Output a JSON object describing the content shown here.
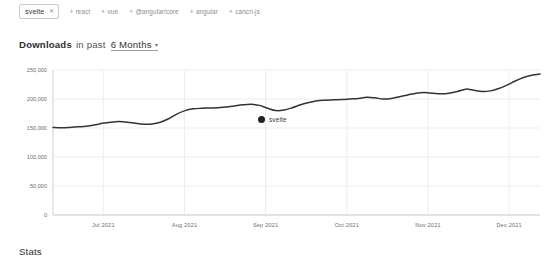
{
  "package_bar": {
    "selected_chip": {
      "label": "svelte",
      "close_icon": "close-icon",
      "close_glyph": "✕"
    },
    "add_items": [
      {
        "plus": "+",
        "label": "react"
      },
      {
        "plus": "+",
        "label": "vue"
      },
      {
        "plus": "+",
        "label": "@angular/core"
      },
      {
        "plus": "+",
        "label": "angular"
      },
      {
        "plus": "+",
        "label": "cancri-js"
      }
    ]
  },
  "downloads_section": {
    "title_strong": "Downloads",
    "title_rest": "in past",
    "range_value": "6 Months",
    "range_caret": "▾"
  },
  "stats_section": {
    "heading": "Stats"
  },
  "chart_data": {
    "type": "line",
    "title": "Downloads in past 6 Months",
    "xlabel": "",
    "ylabel": "",
    "grid": true,
    "legend_position": "top-center",
    "ylim": [
      0,
      250000
    ],
    "yticks": [
      0,
      50000,
      100000,
      150000,
      200000,
      250000
    ],
    "ytick_labels": [
      "0",
      "50,000",
      "100,000",
      "150,000",
      "200,000",
      "250,000"
    ],
    "xticks": [
      "Jul 2021",
      "Aug 2021",
      "Sep 2021",
      "Oct 2021",
      "Nov 2021",
      "Dec 2021"
    ],
    "series": [
      {
        "name": "svelte",
        "color": "#333333",
        "values": [
          151000,
          150500,
          151000,
          152000,
          153000,
          155000,
          158000,
          160000,
          161000,
          160000,
          158000,
          156500,
          157000,
          160000,
          166000,
          174000,
          180000,
          183000,
          184000,
          184500,
          185000,
          186000,
          188000,
          190000,
          191000,
          189000,
          184000,
          180000,
          181000,
          185000,
          190000,
          194000,
          197000,
          198000,
          198500,
          199000,
          200000,
          201000,
          203000,
          202000,
          200000,
          201000,
          204000,
          207000,
          210000,
          211000,
          210000,
          209000,
          210000,
          213000,
          217000,
          215000,
          213000,
          214000,
          218000,
          224000,
          231000,
          237000,
          241000,
          243000
        ]
      }
    ]
  }
}
